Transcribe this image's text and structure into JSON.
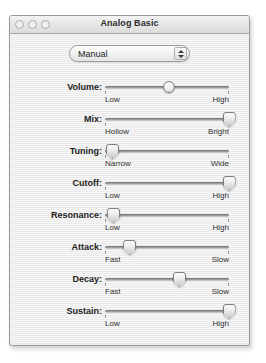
{
  "window": {
    "title": "Analog Basic",
    "traffic_lights": [
      "close-button",
      "minimize-button",
      "zoom-button"
    ]
  },
  "preset_popup": {
    "selected": "Manual",
    "options": [
      "Manual"
    ]
  },
  "sliders": [
    {
      "label": "Volume:",
      "min_label": "Low",
      "max_label": "High",
      "value": 52,
      "thumb": "round"
    },
    {
      "label": "Mix:",
      "min_label": "Hollow",
      "max_label": "Bright",
      "value": 100,
      "thumb": "point"
    },
    {
      "label": "Tuning:",
      "min_label": "Narrow",
      "max_label": "Wide",
      "value": 6,
      "thumb": "point"
    },
    {
      "label": "Cutoff:",
      "min_label": "Low",
      "max_label": "High",
      "value": 100,
      "thumb": "point"
    },
    {
      "label": "Resonance:",
      "min_label": "Low",
      "max_label": "High",
      "value": 7,
      "thumb": "point"
    },
    {
      "label": "Attack:",
      "min_label": "Fast",
      "max_label": "Slow",
      "value": 20,
      "thumb": "point"
    },
    {
      "label": "Decay:",
      "min_label": "Fast",
      "max_label": "Slow",
      "value": 60,
      "thumb": "point"
    },
    {
      "label": "Sustain:",
      "min_label": "Low",
      "max_label": "High",
      "value": 100,
      "thumb": "point"
    }
  ],
  "colors": {
    "window_bg": "#ededed",
    "titlebar_bg": "#e6e6e6",
    "border": "#9a9a9a",
    "text": "#222222",
    "track": "#aaaaaa"
  }
}
